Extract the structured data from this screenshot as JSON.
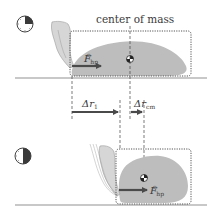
{
  "diagram": {
    "title": "center of mass",
    "colors": {
      "blob": "#bdbdbd",
      "floor": "#c8c8c8",
      "arrow": "#4a4a4a",
      "dotted_box": "#555555",
      "dashed_line": "#444444",
      "text": "#3a3a3a",
      "clock_fill": "#3a3a3a"
    },
    "top_panel": {
      "clock_icon": "clock-quarter-elapsed",
      "force_label": {
        "symbol": "F",
        "subscript": "hp",
        "superscript": "c"
      }
    },
    "bottom_panel": {
      "clock_icon": "clock-half-elapsed",
      "force_label": {
        "symbol": "F",
        "subscript": "hp",
        "superscript": "c"
      }
    },
    "displacements": [
      {
        "symbol": "Δr",
        "subscript": "1"
      },
      {
        "symbol": "Δr",
        "subscript": "cm"
      }
    ]
  }
}
